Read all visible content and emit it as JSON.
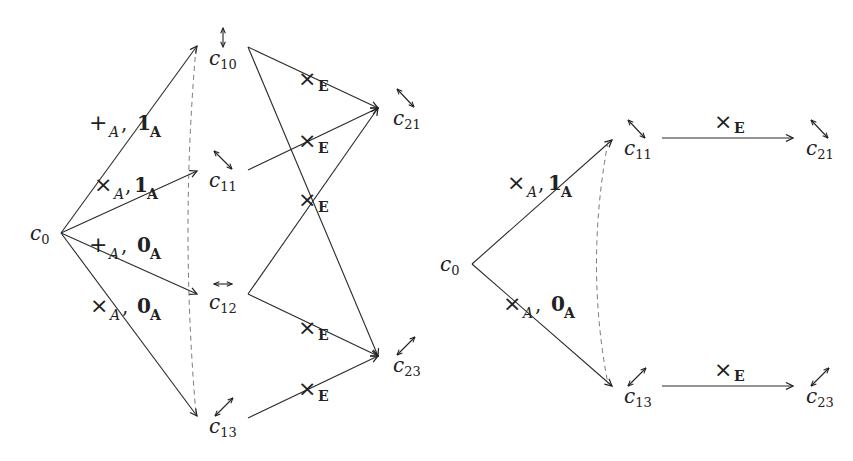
{
  "left_diagram": {
    "root": {
      "base": "c",
      "sub": "0"
    },
    "nodes": [
      {
        "id": "c10",
        "base": "c",
        "sub": "10",
        "icon": "up-down-arrow-icon"
      },
      {
        "id": "c11",
        "base": "c",
        "sub": "11",
        "icon": "diagonal-nw-se-arrow-icon"
      },
      {
        "id": "c12",
        "base": "c",
        "sub": "12",
        "icon": "left-right-arrow-icon"
      },
      {
        "id": "c13",
        "base": "c",
        "sub": "13",
        "icon": "diagonal-ne-sw-arrow-icon"
      },
      {
        "id": "c21",
        "base": "c",
        "sub": "21",
        "icon": "diagonal-nw-se-arrow-icon"
      },
      {
        "id": "c23",
        "base": "c",
        "sub": "23",
        "icon": "diagonal-ne-sw-arrow-icon"
      }
    ],
    "edge_labels": [
      {
        "op": "+",
        "op_sub": "A",
        "sep": ",",
        "val": "1",
        "val_sub": "A"
      },
      {
        "op": "×",
        "op_sub": "A",
        "sep": ",",
        "val": "1",
        "val_sub": "A"
      },
      {
        "op": "+",
        "op_sub": "A",
        "sep": ",",
        "val": "0",
        "val_sub": "A"
      },
      {
        "op": "×",
        "op_sub": "A",
        "sep": ",",
        "val": "0",
        "val_sub": "A"
      }
    ],
    "product_labels": [
      {
        "op": "×",
        "sub": "E"
      },
      {
        "op": "×",
        "sub": "E"
      },
      {
        "op": "×",
        "sub": "E"
      },
      {
        "op": "×",
        "sub": "E"
      },
      {
        "op": "×",
        "sub": "E"
      }
    ]
  },
  "right_diagram": {
    "root": {
      "base": "c",
      "sub": "0"
    },
    "nodes": [
      {
        "id": "c11",
        "base": "c",
        "sub": "11",
        "icon": "diagonal-nw-se-arrow-icon"
      },
      {
        "id": "c13",
        "base": "c",
        "sub": "13",
        "icon": "diagonal-ne-sw-arrow-icon"
      },
      {
        "id": "c21",
        "base": "c",
        "sub": "21",
        "icon": "diagonal-nw-se-arrow-icon"
      },
      {
        "id": "c23",
        "base": "c",
        "sub": "23",
        "icon": "diagonal-ne-sw-arrow-icon"
      }
    ],
    "edge_labels": [
      {
        "op": "×",
        "op_sub": "A",
        "sep": ",",
        "val": "1",
        "val_sub": "A"
      },
      {
        "op": "×",
        "op_sub": "A",
        "sep": ",",
        "val": "0",
        "val_sub": "A"
      }
    ],
    "product_labels": [
      {
        "op": "×",
        "sub": "E"
      },
      {
        "op": "×",
        "sub": "E"
      }
    ]
  }
}
